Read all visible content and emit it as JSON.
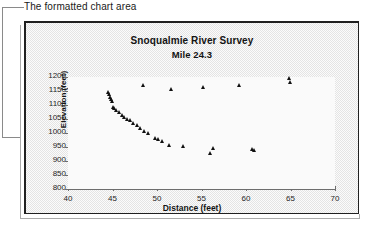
{
  "annotation": {
    "text": "The formatted chart area"
  },
  "chart_data": {
    "type": "scatter",
    "title": "Snoqualmie River Survey",
    "subtitle": "Mile 24.3",
    "xlabel": "Distance (feet)",
    "ylabel": "Elevation (feet)",
    "xlim": [
      40,
      70
    ],
    "ylim": [
      800,
      1200
    ],
    "xticks": [
      40,
      45,
      50,
      55,
      60,
      65,
      70
    ],
    "yticks": [
      800,
      850,
      900,
      950,
      1000,
      1050,
      1100,
      1150,
      1200
    ],
    "grid": false,
    "legend": false,
    "marker": "triangle",
    "marker_color": "#111111",
    "series": [
      {
        "name": "Cross-section",
        "points": [
          [
            44.5,
            1146
          ],
          [
            44.7,
            1138
          ],
          [
            44.8,
            1128
          ],
          [
            44.9,
            1120
          ],
          [
            45.0,
            1112
          ],
          [
            45.1,
            1092
          ],
          [
            45.2,
            1086
          ],
          [
            45.5,
            1082
          ],
          [
            45.8,
            1074
          ],
          [
            46.1,
            1064
          ],
          [
            46.4,
            1056
          ],
          [
            46.7,
            1050
          ],
          [
            47.0,
            1044
          ],
          [
            47.4,
            1034
          ],
          [
            47.8,
            1026
          ],
          [
            48.2,
            1016
          ],
          [
            48.6,
            1004
          ],
          [
            49.0,
            998
          ],
          [
            49.8,
            980
          ],
          [
            50.2,
            976
          ],
          [
            50.6,
            970
          ],
          [
            51.4,
            956
          ],
          [
            53.0,
            952
          ],
          [
            56.0,
            926
          ],
          [
            56.3,
            946
          ],
          [
            60.7,
            940
          ],
          [
            61.0,
            938
          ],
          [
            48.5,
            1168
          ],
          [
            51.6,
            1156
          ],
          [
            55.2,
            1162
          ],
          [
            59.3,
            1170
          ],
          [
            64.9,
            1196
          ],
          [
            65.0,
            1182
          ]
        ]
      }
    ]
  },
  "colors": {
    "marker": "#111111",
    "axis": "#6d6d6d",
    "frame_border": "#202020",
    "text": "#141414"
  }
}
